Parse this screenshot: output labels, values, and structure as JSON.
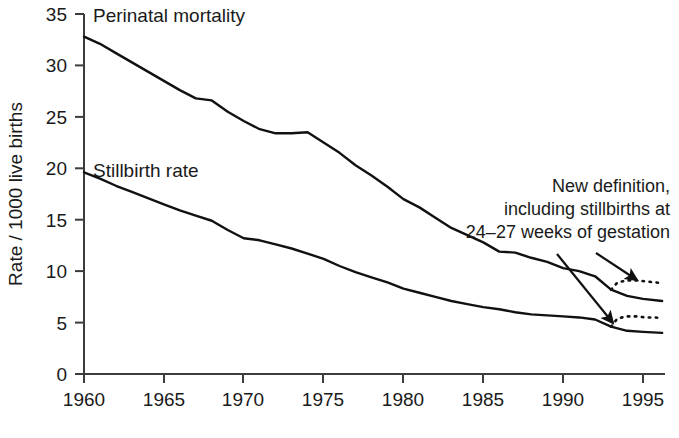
{
  "chart_data": {
    "type": "line",
    "title": "",
    "xlabel": "",
    "ylabel": "Rate / 1000 live births",
    "xlim": [
      1960,
      1996.2
    ],
    "ylim": [
      0,
      35
    ],
    "xticks": [
      "1960",
      "1965",
      "1970",
      "1975",
      "1980",
      "1985",
      "1990",
      "1995"
    ],
    "xtick_values": [
      1960,
      1965,
      1970,
      1975,
      1980,
      1985,
      1990,
      1995
    ],
    "yticks": [
      "0",
      "5",
      "10",
      "15",
      "20",
      "25",
      "30",
      "35"
    ],
    "ytick_values": [
      0,
      5,
      10,
      15,
      20,
      25,
      30,
      35
    ],
    "grid": false,
    "legend_position": "inline-labels",
    "x": [
      1960,
      1961,
      1962,
      1963,
      1964,
      1965,
      1966,
      1967,
      1968,
      1969,
      1970,
      1971,
      1972,
      1973,
      1974,
      1975,
      1976,
      1977,
      1978,
      1979,
      1980,
      1981,
      1982,
      1983,
      1984,
      1985,
      1986,
      1987,
      1988,
      1989,
      1990,
      1991,
      1992,
      1993
    ],
    "series": [
      {
        "name": "Perinatal mortality",
        "style": "solid",
        "values": [
          32.8,
          32.1,
          31.2,
          30.3,
          29.4,
          28.5,
          27.6,
          26.8,
          26.6,
          25.5,
          24.6,
          23.8,
          23.4,
          23.4,
          23.5,
          22.5,
          21.5,
          20.3,
          19.3,
          18.2,
          17.0,
          16.2,
          15.2,
          14.2,
          13.5,
          12.8,
          11.9,
          11.8,
          11.3,
          10.9,
          10.3,
          10.0,
          9.5,
          8.2
        ]
      },
      {
        "name": "Stillbirth rate",
        "style": "solid",
        "values": [
          19.6,
          19.0,
          18.3,
          17.7,
          17.1,
          16.5,
          15.9,
          15.4,
          14.9,
          14.0,
          13.2,
          13.0,
          12.6,
          12.2,
          11.7,
          11.2,
          10.5,
          9.9,
          9.4,
          8.9,
          8.3,
          7.9,
          7.5,
          7.1,
          6.8,
          6.5,
          6.3,
          6.0,
          5.8,
          5.7,
          5.6,
          5.5,
          5.3,
          4.6
        ]
      }
    ],
    "new_definition_segments": [
      {
        "name": "Perinatal mortality (new definition)",
        "style": "dotted",
        "x": [
          1993,
          1993.4,
          1994,
          1994.6,
          1995.2,
          1995.8,
          1996.2
        ],
        "values": [
          8.2,
          8.9,
          9.1,
          9.1,
          9.0,
          8.9,
          8.8
        ]
      },
      {
        "name": "Stillbirth rate (new definition)",
        "style": "dotted",
        "x": [
          1993,
          1993.4,
          1994,
          1994.6,
          1995.2,
          1995.8,
          1996.2
        ],
        "values": [
          4.6,
          5.4,
          5.6,
          5.6,
          5.5,
          5.5,
          5.4
        ]
      }
    ],
    "solid_tail": [
      {
        "name": "Perinatal mortality (old definition tail)",
        "x": [
          1993,
          1994,
          1995,
          1996.2
        ],
        "values": [
          8.2,
          7.6,
          7.3,
          7.1
        ]
      },
      {
        "name": "Stillbirth rate (old definition tail)",
        "x": [
          1993,
          1994,
          1995,
          1996.2
        ],
        "values": [
          4.6,
          4.2,
          4.1,
          4.0
        ]
      }
    ],
    "annotations": [
      {
        "name": "new-definition-note",
        "lines": [
          "New definition,",
          "including stillbirths at",
          "24–27 weeks of gestation"
        ],
        "arrows": 2
      }
    ]
  },
  "labels": {
    "perinatal": "Perinatal mortality",
    "stillbirth": "Stillbirth rate",
    "y_axis": "Rate / 1000 live births",
    "annotation_line1": "New definition,",
    "annotation_line2": "including stillbirths at",
    "annotation_line3": "24–27 weeks of gestation"
  },
  "axis": {
    "x0": "1960",
    "x1": "1965",
    "x2": "1970",
    "x3": "1975",
    "x4": "1980",
    "x5": "1985",
    "x6": "1990",
    "x7": "1995",
    "y0": "0",
    "y1": "5",
    "y2": "10",
    "y3": "15",
    "y4": "20",
    "y5": "25",
    "y6": "30",
    "y7": "35"
  },
  "colors": {
    "ink": "#1a1a1a",
    "line": "#111111",
    "background": "#ffffff"
  }
}
